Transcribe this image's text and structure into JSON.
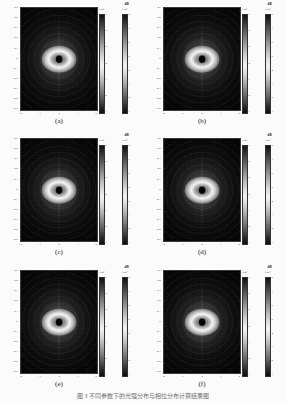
{
  "figure": {
    "caption": "图 3  不同参数下的光强分布与相位分布计算结果图",
    "background_color": "#fbfbfb",
    "colormap": "grayscale"
  },
  "axes_common": {
    "y_ticks": [
      "0.5",
      "0.4",
      "0.3",
      "0.2",
      "0.1",
      "0",
      "-0.1",
      "-0.2",
      "-0.3",
      "-0.4",
      "-0.5"
    ],
    "x_ticks": [
      "-2",
      "-1",
      "0",
      "1",
      "2"
    ]
  },
  "colorbar_common": {
    "intensity": {
      "multiplier": "×10⁴",
      "unit": "",
      "ticks": [
        "7",
        "6",
        "5",
        "4",
        "3",
        "2",
        "1"
      ]
    },
    "phase": {
      "multiplier": "×10⁴",
      "unit": "dB",
      "ticks": [
        "8",
        "7",
        "6",
        "5",
        "4",
        "3",
        "2",
        "1"
      ]
    }
  },
  "chart_data": {
    "type": "heatmap",
    "title": "图 3  不同参数下的光强分布与相位分布计算结果图",
    "xlabel": "",
    "ylabel": "",
    "grid": false,
    "legend_position": "right",
    "colormap": "grayscale",
    "panel_count": 6,
    "panel_layout": "3 rows × 2 columns",
    "xlim": [
      -2,
      2
    ],
    "ylim": [
      -0.5,
      0.5
    ],
    "pattern": "elliptical Airy-type diffraction pattern with dark central core, bright elliptical main lobe and concentric decaying rings",
    "panels": [
      {
        "label": "(a)",
        "row": 0,
        "col": 0,
        "xlim": [
          -2,
          2
        ],
        "ylim": [
          -0.5,
          0.5
        ],
        "x_ticks": [
          "-2",
          "-1",
          "0",
          "1",
          "2"
        ],
        "y_ticks": [
          "0.5",
          "0.4",
          "0.3",
          "0.2",
          "0.1",
          "0",
          "-0.1",
          "-0.2",
          "-0.3",
          "-0.4",
          "-0.5"
        ],
        "colorbars": [
          {
            "name": "intensity",
            "multiplier": "×10⁴",
            "unit": "",
            "ticks": [
              "7",
              "6",
              "5",
              "4",
              "3",
              "2",
              "1"
            ],
            "range": [
              1,
              7
            ]
          },
          {
            "name": "phase",
            "multiplier": "×10⁴",
            "unit": "dB",
            "ticks": [
              "8",
              "7",
              "6",
              "5",
              "4",
              "3",
              "2",
              "1"
            ],
            "range": [
              1,
              8
            ]
          }
        ]
      },
      {
        "label": "(b)",
        "row": 0,
        "col": 1,
        "xlim": [
          -2,
          2
        ],
        "ylim": [
          -0.5,
          0.5
        ],
        "x_ticks": [
          "-2",
          "-1",
          "0",
          "1",
          "2"
        ],
        "y_ticks": [
          "0.5",
          "0.4",
          "0.3",
          "0.2",
          "0.1",
          "0",
          "-0.1",
          "-0.2",
          "-0.3",
          "-0.4",
          "-0.5"
        ],
        "colorbars": [
          {
            "name": "intensity",
            "multiplier": "×10⁴",
            "unit": "",
            "ticks": [
              "7",
              "6",
              "5",
              "4",
              "3",
              "2",
              "1"
            ],
            "range": [
              1,
              7
            ]
          },
          {
            "name": "phase",
            "multiplier": "×10⁴",
            "unit": "dB",
            "ticks": [
              "8",
              "7",
              "6",
              "5",
              "4",
              "3",
              "2",
              "1"
            ],
            "range": [
              1,
              8
            ]
          }
        ]
      },
      {
        "label": "(c)",
        "row": 1,
        "col": 0,
        "xlim": [
          -2,
          2
        ],
        "ylim": [
          -0.5,
          0.5
        ],
        "x_ticks": [
          "-2",
          "-1",
          "0",
          "1",
          "2"
        ],
        "y_ticks": [
          "0.5",
          "0.4",
          "0.3",
          "0.2",
          "0.1",
          "0",
          "-0.1",
          "-0.2",
          "-0.3",
          "-0.4",
          "-0.5"
        ],
        "colorbars": [
          {
            "name": "intensity",
            "multiplier": "×10⁴",
            "unit": "",
            "ticks": [
              "7",
              "6",
              "5",
              "4",
              "3",
              "2",
              "1"
            ],
            "range": [
              1,
              7
            ]
          },
          {
            "name": "phase",
            "multiplier": "×10⁴",
            "unit": "dB",
            "ticks": [
              "8",
              "7",
              "6",
              "5",
              "4",
              "3",
              "2",
              "1"
            ],
            "range": [
              1,
              8
            ]
          }
        ]
      },
      {
        "label": "(d)",
        "row": 1,
        "col": 1,
        "xlim": [
          -2,
          2
        ],
        "ylim": [
          -0.5,
          0.5
        ],
        "x_ticks": [
          "-2",
          "-1",
          "0",
          "1",
          "2"
        ],
        "y_ticks": [
          "0.5",
          "0.4",
          "0.3",
          "0.2",
          "0.1",
          "0",
          "-0.1",
          "-0.2",
          "-0.3",
          "-0.4",
          "-0.5"
        ],
        "colorbars": [
          {
            "name": "intensity",
            "multiplier": "×10⁴",
            "unit": "",
            "ticks": [
              "7",
              "6",
              "5",
              "4",
              "3",
              "2",
              "1"
            ],
            "range": [
              1,
              7
            ]
          },
          {
            "name": "phase",
            "multiplier": "×10⁴",
            "unit": "dB",
            "ticks": [
              "8",
              "7",
              "6",
              "5",
              "4",
              "3",
              "2",
              "1"
            ],
            "range": [
              1,
              8
            ]
          }
        ]
      },
      {
        "label": "(e)",
        "row": 2,
        "col": 0,
        "xlim": [
          -2,
          2
        ],
        "ylim": [
          -0.5,
          0.5
        ],
        "x_ticks": [
          "-2",
          "-1",
          "0",
          "1",
          "2"
        ],
        "y_ticks": [
          "0.5",
          "0.4",
          "0.3",
          "0.2",
          "0.1",
          "0",
          "-0.1",
          "-0.2",
          "-0.3",
          "-0.4",
          "-0.5"
        ],
        "colorbars": [
          {
            "name": "intensity",
            "multiplier": "×10⁴",
            "unit": "",
            "ticks": [
              "7",
              "6",
              "5",
              "4",
              "3",
              "2",
              "1"
            ],
            "range": [
              1,
              7
            ]
          },
          {
            "name": "phase",
            "multiplier": "×10⁴",
            "unit": "dB",
            "ticks": [
              "8",
              "7",
              "6",
              "5",
              "4",
              "3",
              "2",
              "1"
            ],
            "range": [
              1,
              8
            ]
          }
        ]
      },
      {
        "label": "(f)",
        "row": 2,
        "col": 1,
        "xlim": [
          -2,
          2
        ],
        "ylim": [
          -0.5,
          0.5
        ],
        "x_ticks": [
          "-2",
          "-1",
          "0",
          "1",
          "2"
        ],
        "y_ticks": [
          "0.5",
          "0.4",
          "0.3",
          "0.2",
          "0.1",
          "0",
          "-0.1",
          "-0.2",
          "-0.3",
          "-0.4",
          "-0.5"
        ],
        "colorbars": [
          {
            "name": "intensity",
            "multiplier": "×10⁴",
            "unit": "",
            "ticks": [
              "7",
              "6",
              "5",
              "4",
              "3",
              "2",
              "1"
            ],
            "range": [
              1,
              7
            ]
          },
          {
            "name": "phase",
            "multiplier": "×10⁴",
            "unit": "dB",
            "ticks": [
              "8",
              "7",
              "6",
              "5",
              "4",
              "3",
              "2",
              "1"
            ],
            "range": [
              1,
              8
            ]
          }
        ]
      }
    ]
  }
}
